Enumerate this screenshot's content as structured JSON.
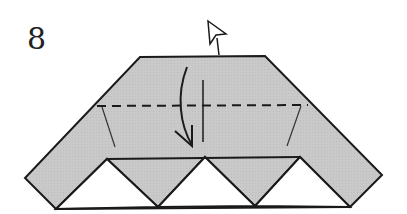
{
  "diagram": {
    "step_number": "8",
    "colors": {
      "paper_fill": "#c8c8c8",
      "outline": "#1a1a1a",
      "background": "#ffffff",
      "white_gap": "#ffffff"
    },
    "elements": {
      "paper_shape": "trapezoidal-chevron folded paper (gray)",
      "white_triangles": 3,
      "valley_fold_line": "dashed horizontal line",
      "fold_arrow": "curved arrow folding top flap down",
      "push_arrow": "hollow arrow pointing up-right (fold behind / unfold)",
      "hinge_lines": 2,
      "center_crease": "vertical line"
    }
  }
}
